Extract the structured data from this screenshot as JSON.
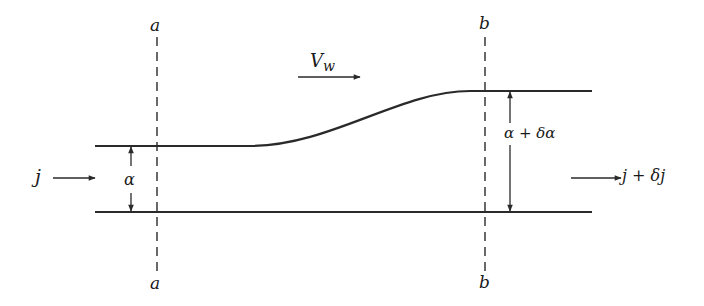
{
  "diagram": {
    "type": "channel-flow-schematic",
    "stroke_color": "#2a2a2a",
    "background": "#ffffff",
    "sections": [
      {
        "id": "a",
        "top_label": "a",
        "bottom_label": "a"
      },
      {
        "id": "b",
        "top_label": "b",
        "bottom_label": "b"
      }
    ],
    "labels": {
      "velocity": "Vw",
      "velocity_main": "V",
      "velocity_sub": "w",
      "inflow": "j",
      "outflow": "j + δj",
      "height_in": "α",
      "height_out": "α + δα"
    },
    "arrows": [
      {
        "name": "velocity-arrow",
        "direction": "right"
      },
      {
        "name": "inflow-arrow",
        "direction": "right"
      },
      {
        "name": "outflow-arrow",
        "direction": "right"
      },
      {
        "name": "height-in-dimension",
        "direction": "both-vertical"
      },
      {
        "name": "height-out-dimension",
        "direction": "both-vertical"
      }
    ]
  }
}
